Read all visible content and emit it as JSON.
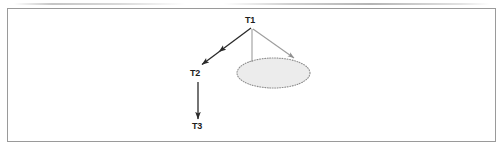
{
  "figure": {
    "type": "vector-diagram",
    "background_color": "#ffffff",
    "frame": {
      "border_color": "#9a9a9a",
      "fill_color": "#ffffff",
      "x": 7,
      "y": 8,
      "width": 489,
      "height": 134
    },
    "scan_artifact": {
      "name": "horizontal-scan-streak",
      "color": "#8c8c8c"
    }
  },
  "labels": {
    "t1": "T1",
    "t2": "T2",
    "t3": "T3"
  },
  "nodes": [
    {
      "id": "T1",
      "label": "T1",
      "x": 252,
      "y": 28,
      "label_x": 245,
      "label_y": 16
    },
    {
      "id": "T2",
      "label": "T2",
      "x": 198,
      "y": 66,
      "label_x": 190,
      "label_y": 69
    },
    {
      "id": "T3",
      "label": "T3",
      "x": 198,
      "y": 121,
      "label_x": 192,
      "label_y": 122
    }
  ],
  "shapes": [
    {
      "name": "stippled-ellipse",
      "type": "ellipse",
      "cx": 273.5,
      "cy": 73,
      "rx": 36.5,
      "ry": 15,
      "fill_color": "#ececec",
      "stroke_color": "#8e8e8e",
      "stroke_style": "dotted"
    }
  ],
  "edges": [
    {
      "name": "t1-to-t2-arrow",
      "from": "T1",
      "to": "T2",
      "x1": 252,
      "y1": 28,
      "x2": 201,
      "y2": 66,
      "stroke_color": "#2a2a2a",
      "arrowheads": 2,
      "arrowhead_positions": [
        "midpoint",
        "end"
      ]
    },
    {
      "name": "t1-to-ellipse-vertical-line",
      "from": "T1",
      "to": "ellipse-top",
      "x1": 252,
      "y1": 29,
      "x2": 252,
      "y2": 62,
      "stroke_color": "#9d9d9d",
      "arrowheads": 0
    },
    {
      "name": "t1-to-ellipse-diagonal-arrow",
      "from": "T1",
      "to": "ellipse-right",
      "x1": 253,
      "y1": 29,
      "x2": 296,
      "y2": 59,
      "stroke_color": "#9d9d9d",
      "arrowheads": 1,
      "arrowhead_positions": [
        "end"
      ]
    },
    {
      "name": "t2-to-t3-arrow",
      "from": "T2",
      "to": "T3",
      "x1": 198,
      "y1": 81,
      "x2": 198,
      "y2": 121,
      "stroke_color": "#2a2a2a",
      "arrowheads": 1,
      "arrowhead_positions": [
        "end"
      ]
    }
  ],
  "colors": {
    "frame_border": "#9a9a9a",
    "dark_stroke": "#2a2a2a",
    "light_stroke": "#9d9d9d",
    "ellipse_fill": "#ececec",
    "ellipse_stroke": "#8e8e8e",
    "text": "#1d1d1d"
  }
}
